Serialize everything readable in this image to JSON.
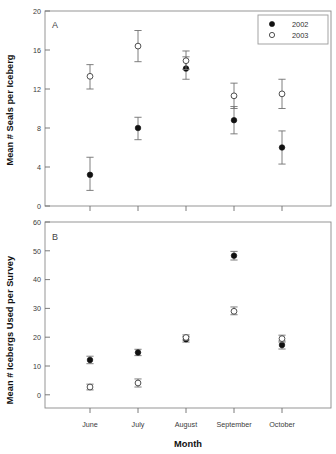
{
  "figure": {
    "background": "#ffffff",
    "xlabel": "Month",
    "categories": [
      "June",
      "July",
      "August",
      "September",
      "October"
    ],
    "legend": {
      "position": "top-right-panel-A",
      "entries": [
        {
          "label": "2002",
          "marker": "filled-circle",
          "color": "#111111"
        },
        {
          "label": "2003",
          "marker": "open-circle",
          "color": "#ffffff"
        }
      ]
    }
  },
  "chart_data": [
    {
      "type": "scatter",
      "panel": "A",
      "panel_label": "A",
      "title": "",
      "xlabel": "",
      "ylabel": "Mean # Seals per Iceberg",
      "categories": [
        "June",
        "July",
        "August",
        "September",
        "October"
      ],
      "ylim": [
        0,
        20
      ],
      "yticks": [
        0,
        4,
        8,
        12,
        16,
        20
      ],
      "grid": false,
      "error_bars": "mean +/- SE",
      "series": [
        {
          "name": "2002",
          "marker": "filled-circle",
          "values": [
            3.2,
            8.0,
            14.1,
            8.8,
            6.0
          ],
          "err_low": [
            1.6,
            6.8,
            13.0,
            7.4,
            4.3
          ],
          "err_high": [
            5.0,
            9.1,
            15.3,
            10.2,
            7.7
          ]
        },
        {
          "name": "2003",
          "marker": "open-circle",
          "values": [
            13.3,
            16.4,
            14.9,
            11.3,
            11.5
          ],
          "err_low": [
            12.0,
            14.8,
            14.0,
            10.0,
            10.0
          ],
          "err_high": [
            14.5,
            18.0,
            15.9,
            12.6,
            13.0
          ]
        }
      ]
    },
    {
      "type": "scatter",
      "panel": "B",
      "panel_label": "B",
      "title": "",
      "xlabel": "Month",
      "ylabel": "Mean # Icebergs Used per Survey",
      "categories": [
        "June",
        "July",
        "August",
        "September",
        "October"
      ],
      "ylim": [
        0,
        60
      ],
      "yticks": [
        0,
        10,
        20,
        30,
        40,
        50,
        60
      ],
      "grid": false,
      "error_bars": "mean +/- SE",
      "series": [
        {
          "name": "2002",
          "marker": "filled-circle",
          "values": [
            12.1,
            14.7,
            19.3,
            48.3,
            17.3
          ],
          "err_low": [
            10.8,
            13.6,
            18.3,
            46.8,
            15.9
          ],
          "err_high": [
            13.4,
            15.8,
            20.2,
            49.8,
            18.7
          ]
        },
        {
          "name": "2003",
          "marker": "open-circle",
          "values": [
            2.7,
            4.1,
            19.9,
            29.0,
            19.5
          ],
          "err_low": [
            1.7,
            2.7,
            19.0,
            27.8,
            18.3
          ],
          "err_high": [
            3.7,
            5.5,
            20.8,
            30.5,
            20.7
          ]
        }
      ]
    }
  ],
  "panelA_ticklabels": [
    "20",
    "16",
    "12",
    "8",
    "4",
    "0"
  ],
  "panelB_ticklabels": [
    "60",
    "50",
    "40",
    "30",
    "20",
    "10",
    "0"
  ]
}
